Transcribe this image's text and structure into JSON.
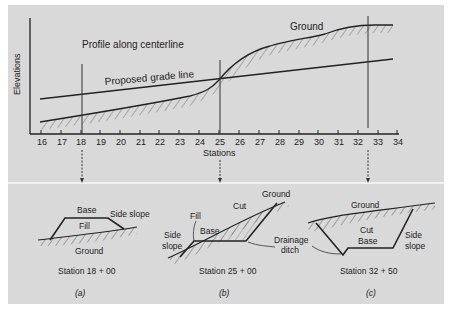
{
  "profile": {
    "title": "Profile along centerline",
    "ylabel": "Elevations",
    "xlabel": "Stations",
    "ground_label": "Ground",
    "grade_label": "Proposed grade line",
    "ticks": [
      "16",
      "17",
      "18",
      "19",
      "20",
      "21",
      "22",
      "23",
      "24",
      "25",
      "26",
      "27",
      "28",
      "29",
      "30",
      "31",
      "32",
      "33",
      "34"
    ]
  },
  "sections": [
    {
      "id": "a",
      "caption": "(a)",
      "station": "Station 18 + 00",
      "labels": {
        "base": "Base",
        "side_slope": "Side slope",
        "fill": "Fill",
        "ground": "Ground"
      }
    },
    {
      "id": "b",
      "caption": "(b)",
      "station": "Station 25 + 00",
      "labels": {
        "ground": "Ground",
        "cut": "Cut",
        "fill": "Fill",
        "base": "Base",
        "side": "Side",
        "slope": "slope",
        "drainage": "Drainage",
        "ditch": "ditch"
      }
    },
    {
      "id": "c",
      "caption": "(c)",
      "station": "Station 32 + 50",
      "labels": {
        "ground": "Ground",
        "cut": "Cut",
        "base": "Base",
        "side": "Side",
        "slope": "slope"
      }
    }
  ],
  "colors": {
    "panel_bg": "#d9d9d9",
    "ink": "#1e1e1e",
    "divider": "#f0f0f0"
  }
}
